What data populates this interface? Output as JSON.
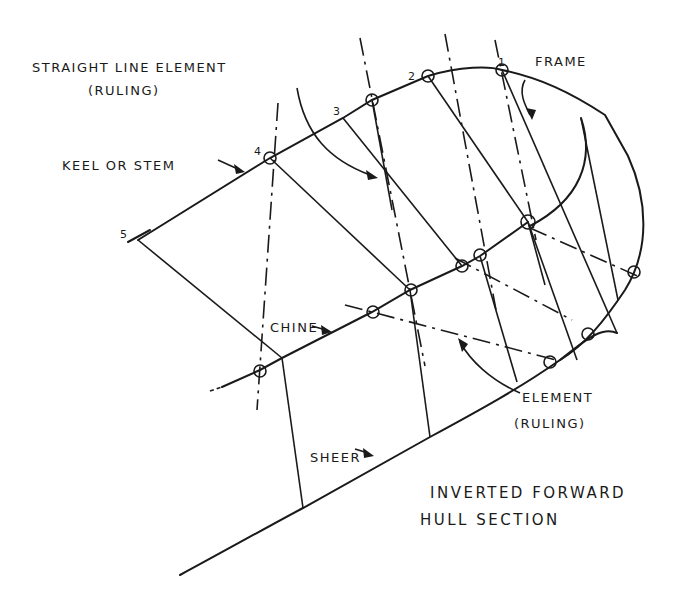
{
  "diagram": {
    "title": "Inverted Forward Hull Section",
    "labels": {
      "straight_line_element": "STRAIGHT LINE  ELEMENT",
      "ruling_top": "(RULING)",
      "keel_or_stem": "KEEL OR STEM",
      "frame": "FRAME",
      "chine": "CHINE",
      "element": "ELEMENT",
      "ruling_bottom": "(RULING)",
      "sheer": "SHEER",
      "caption_line1": "INVERTED FORWARD",
      "caption_line2": "HULL SECTION"
    },
    "station_numbers": [
      "1",
      "2",
      "3",
      "4",
      "5"
    ],
    "colors": {
      "ink": "#1a1a1a",
      "paper": "#ffffff"
    }
  }
}
